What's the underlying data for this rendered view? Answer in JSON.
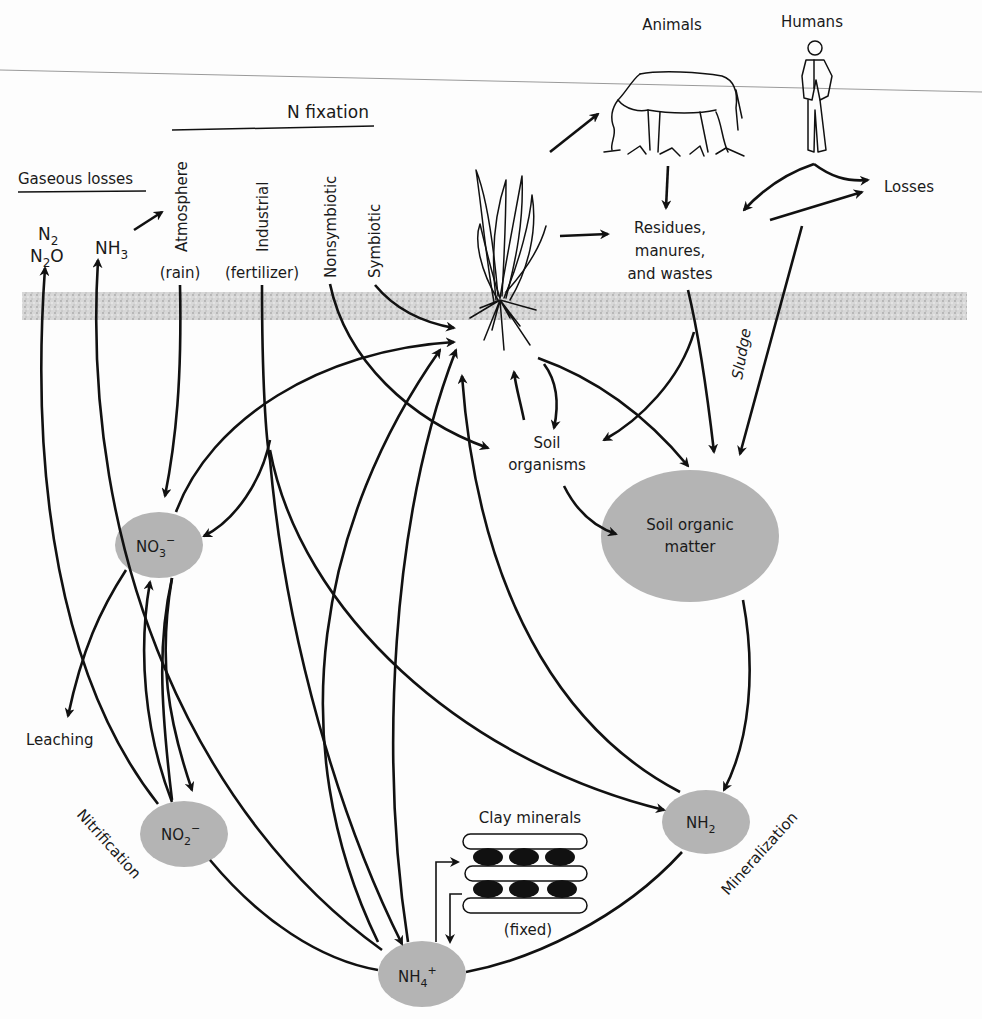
{
  "diagram": {
    "title_fixation": "N fixation",
    "gaseous_losses": "Gaseous losses",
    "gases": {
      "n2": "N",
      "n2_sub": "2",
      "n2o": "N",
      "n2o_sub": "2",
      "n2o_tail": "O",
      "nh3": "NH",
      "nh3_sub": "3"
    },
    "fixation_sources": [
      {
        "id": "atmosphere",
        "label": "Atmosphere",
        "sub": "(rain)"
      },
      {
        "id": "industrial",
        "label": "Industrial",
        "sub": "(fertilizer)"
      },
      {
        "id": "nonsymbiotic",
        "label": "Nonsymbiotic",
        "sub": ""
      },
      {
        "id": "symbiotic",
        "label": "Symbiotic",
        "sub": ""
      }
    ],
    "top_labels": {
      "animals": "Animals",
      "humans": "Humans",
      "losses": "Losses"
    },
    "residues": {
      "line1": "Residues,",
      "line2": "manures,",
      "line3": "and wastes"
    },
    "sludge": "Sludge",
    "soil_organisms": {
      "line1": "Soil",
      "line2": "organisms"
    },
    "nodes": {
      "som": {
        "line1": "Soil organic",
        "line2": "matter"
      },
      "no3": {
        "base": "NO",
        "sub": "3",
        "sup": "−"
      },
      "no2": {
        "base": "NO",
        "sub": "2",
        "sup": "−"
      },
      "nh4": {
        "base": "NH",
        "sub": "4",
        "sup": "+"
      },
      "nh2": {
        "base": "NH",
        "sub": "2",
        "sup": ""
      }
    },
    "process_labels": {
      "leaching": "Leaching",
      "nitrification": "Nitrification",
      "mineralization": "Mineralization"
    },
    "clay": {
      "title": "Clay minerals",
      "caption": "(fixed)"
    },
    "colors": {
      "node_fill": "#b4b4b4",
      "soil_band": "#c8c8c8",
      "ink": "#111111"
    }
  }
}
